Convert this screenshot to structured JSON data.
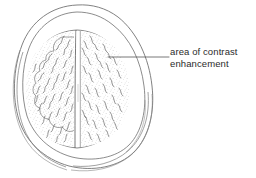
{
  "figure": {
    "type": "medical-line-illustration",
    "background_color": "#ffffff",
    "ink_color": "#5a5a5a",
    "text_color": "#2b2b2b",
    "annotations": [
      {
        "id": "contrast-enhancement",
        "line_1": "area of contrast",
        "line_2": "enhancement",
        "leader_from_x": 108,
        "leader_from_y": 57,
        "leader_to_x": 169,
        "leader_to_y": 57
      }
    ],
    "structures": [
      {
        "name": "scalp-outline",
        "label": "scalp outline"
      },
      {
        "name": "skull-outline",
        "label": "skull outline"
      },
      {
        "name": "brain-surface",
        "label": "brain surface"
      },
      {
        "name": "interhemispheric-fissure",
        "label": "interhemispheric fissure"
      },
      {
        "name": "left-hemisphere",
        "label": "left hemisphere"
      },
      {
        "name": "right-hemisphere",
        "label": "right hemisphere"
      },
      {
        "name": "enhancement-region",
        "label": "area of contrast enhancement"
      }
    ]
  }
}
